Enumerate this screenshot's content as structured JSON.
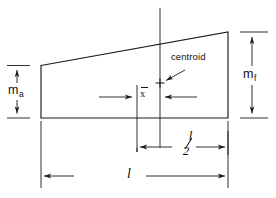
{
  "figure": {
    "line_color": "#1a1a1a",
    "background": "#ffffff",
    "labels": {
      "m_a": "m",
      "m_a_sub": "a",
      "m_f": "m",
      "m_f_sub": "f",
      "centroid": "centroid",
      "x_bar": "x",
      "half_length_numerator": "l",
      "half_length_denominator": "2",
      "length": "l"
    },
    "dimensions": [
      {
        "name": "m_a",
        "label": "m_a",
        "orientation": "vertical",
        "side": "left",
        "description": "aft depth of trapezoid at left edge"
      },
      {
        "name": "m_f",
        "label": "m_f",
        "orientation": "vertical",
        "side": "right",
        "description": "forward depth of trapezoid at right edge"
      },
      {
        "name": "x_bar",
        "label": "x",
        "orientation": "horizontal",
        "description": "distance from centroid to half-length station"
      },
      {
        "name": "half_length",
        "label": "l/2",
        "orientation": "horizontal",
        "description": "half of the overall length"
      },
      {
        "name": "length",
        "label": "l",
        "orientation": "horizontal",
        "description": "overall length of the trapezoid"
      }
    ],
    "markers": [
      {
        "name": "centroid-marker",
        "glyph": "+",
        "annotation": "centroid"
      }
    ]
  }
}
